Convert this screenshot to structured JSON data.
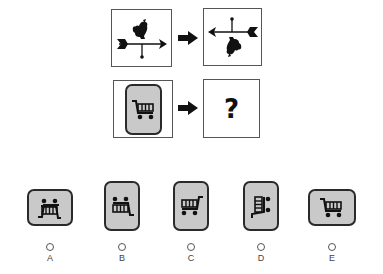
{
  "puzzle": {
    "example": {
      "source_icon": "weathervane-rooster-icon",
      "target_icon": "weathervane-rooster-rotated-180-icon"
    },
    "question": {
      "source_icon": "shopping-cart-icon",
      "unknown_label": "?"
    },
    "arrow_icon": "right-arrow-icon"
  },
  "colors": {
    "tile_fill": "#c9c9c9",
    "tile_border": "#2a2a2a",
    "frame_border": "#555555",
    "icon": "#111111"
  },
  "options": [
    {
      "letter": "A",
      "icon": "shopping-cart-rotated-icon",
      "orientation": "landscape"
    },
    {
      "letter": "B",
      "icon": "shopping-cart-flipped-vertical-icon",
      "orientation": "portrait"
    },
    {
      "letter": "C",
      "icon": "shopping-cart-mirrored-icon",
      "orientation": "portrait"
    },
    {
      "letter": "D",
      "icon": "shopping-cart-rotated-90-icon",
      "orientation": "portrait"
    },
    {
      "letter": "E",
      "icon": "shopping-cart-icon",
      "orientation": "landscape"
    }
  ]
}
